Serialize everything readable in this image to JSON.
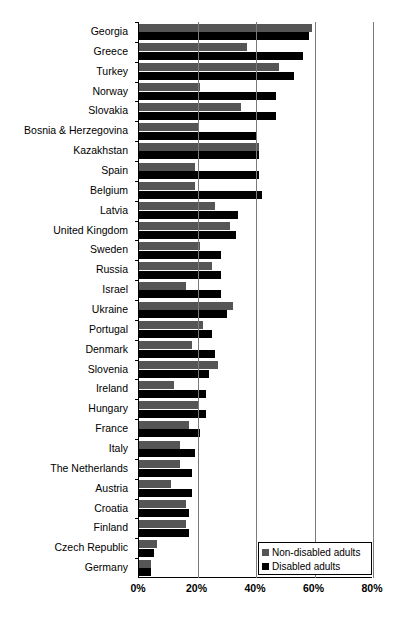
{
  "chart_data": {
    "type": "bar",
    "orientation": "horizontal",
    "title": "",
    "xlabel": "",
    "ylabel": "",
    "xlim": [
      0,
      80
    ],
    "xticks": [
      "0%",
      "20%",
      "40%",
      "60%",
      "80%"
    ],
    "xtick_values": [
      0,
      20,
      40,
      60,
      80
    ],
    "grid": true,
    "legend_position": "bottom-right",
    "categories": [
      "Georgia",
      "Greece",
      "Turkey",
      "Norway",
      "Slovakia",
      "Bosnia & Herzegovina",
      "Kazakhstan",
      "Spain",
      "Belgium",
      "Latvia",
      "United Kingdom",
      "Sweden",
      "Russia",
      "Israel",
      "Ukraine",
      "Portugal",
      "Denmark",
      "Slovenia",
      "Ireland",
      "Hungary",
      "France",
      "Italy",
      "The Netherlands",
      "Austria",
      "Croatia",
      "Finland",
      "Czech Republic",
      "Germany"
    ],
    "series": [
      {
        "name": "Non-disabled adults",
        "color": "#555555",
        "values": [
          59,
          37,
          48,
          21,
          35,
          20,
          41,
          19,
          19,
          26,
          31,
          21,
          25,
          16,
          32,
          22,
          18,
          27,
          12,
          20,
          17,
          14,
          14,
          11,
          16,
          16,
          6,
          4
        ]
      },
      {
        "name": "Disabled adults",
        "color": "#000000",
        "values": [
          58,
          56,
          53,
          47,
          47,
          40,
          41,
          41,
          42,
          34,
          33,
          28,
          28,
          28,
          30,
          25,
          26,
          24,
          23,
          23,
          21,
          19,
          18,
          18,
          17,
          17,
          5,
          4
        ]
      }
    ]
  },
  "legend": {
    "items": [
      {
        "label": "Non-disabled adults",
        "swatch": "nondis"
      },
      {
        "label": "Disabled adults",
        "swatch": "dis"
      }
    ]
  }
}
